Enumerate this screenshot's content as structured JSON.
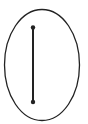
{
  "diagram": {
    "shapes": [
      {
        "kind": "ellipse",
        "name": "outer-ellipse"
      },
      {
        "kind": "segment",
        "name": "vertical-segment",
        "endpoints": 2
      }
    ],
    "colors": {
      "stroke": "#222222",
      "background": "#ffffff"
    }
  }
}
